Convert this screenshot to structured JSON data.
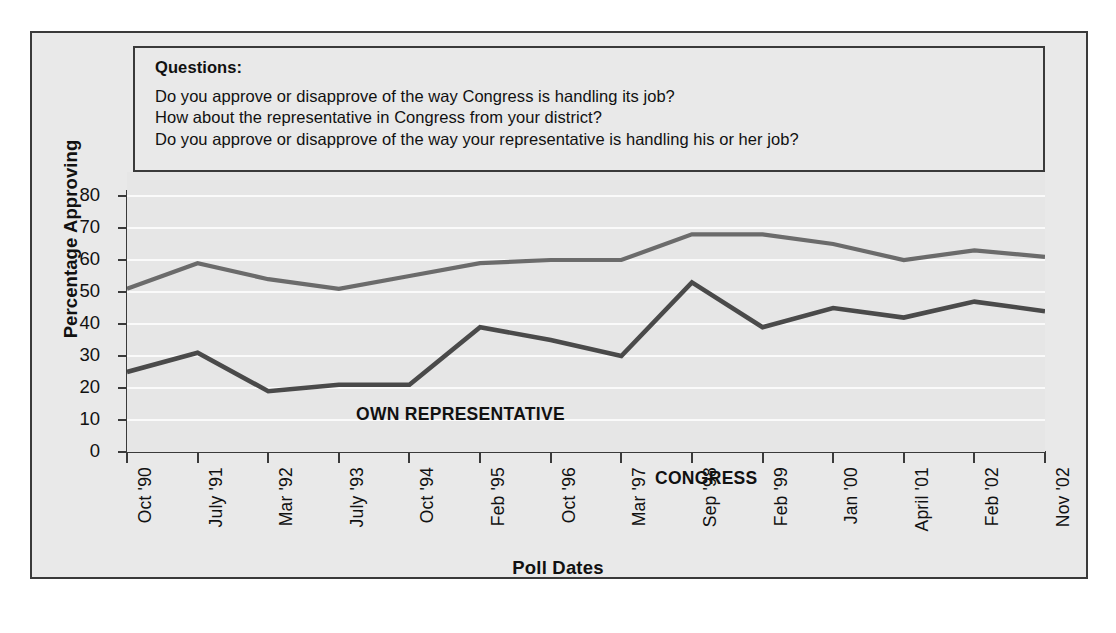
{
  "panel": {
    "heading": "Questions:",
    "lines": [
      "Do you approve or disapprove of the way Congress is handling its job?",
      "How about the representative in Congress from your district?",
      "Do you approve or disapprove of the way your representative is handling his or her job?"
    ]
  },
  "chart_data": {
    "type": "line",
    "title": "",
    "xlabel": "Poll Dates",
    "ylabel": "Percentage Approving",
    "ylim": [
      0,
      80
    ],
    "yticks": [
      0,
      10,
      20,
      30,
      40,
      50,
      60,
      70,
      80
    ],
    "grid": true,
    "legend_position": "inline-labels",
    "categories": [
      "Oct '90",
      "July '91",
      "Mar '92",
      "July '93",
      "Oct '94",
      "Feb '95",
      "Oct '96",
      "Mar '97",
      "Sep '98",
      "Feb '99",
      "Jan '00",
      "April '01",
      "Feb '02",
      "Nov '02"
    ],
    "series": [
      {
        "name": "OWN REPRESENTATIVE",
        "color": "#6b6b6b",
        "values": [
          51,
          59,
          54,
          51,
          55,
          59,
          60,
          60,
          68,
          68,
          65,
          60,
          63,
          61
        ]
      },
      {
        "name": "CONGRESS",
        "color": "#4a4a4a",
        "values": [
          25,
          31,
          19,
          21,
          21,
          39,
          35,
          30,
          53,
          39,
          45,
          42,
          47,
          44
        ]
      }
    ]
  },
  "colors": {
    "frame": "#3a3a3a",
    "plot_background": "#e6e6e6",
    "page_background": "#e9e9e9",
    "gridline": "#fafafa",
    "text": "#111111"
  }
}
